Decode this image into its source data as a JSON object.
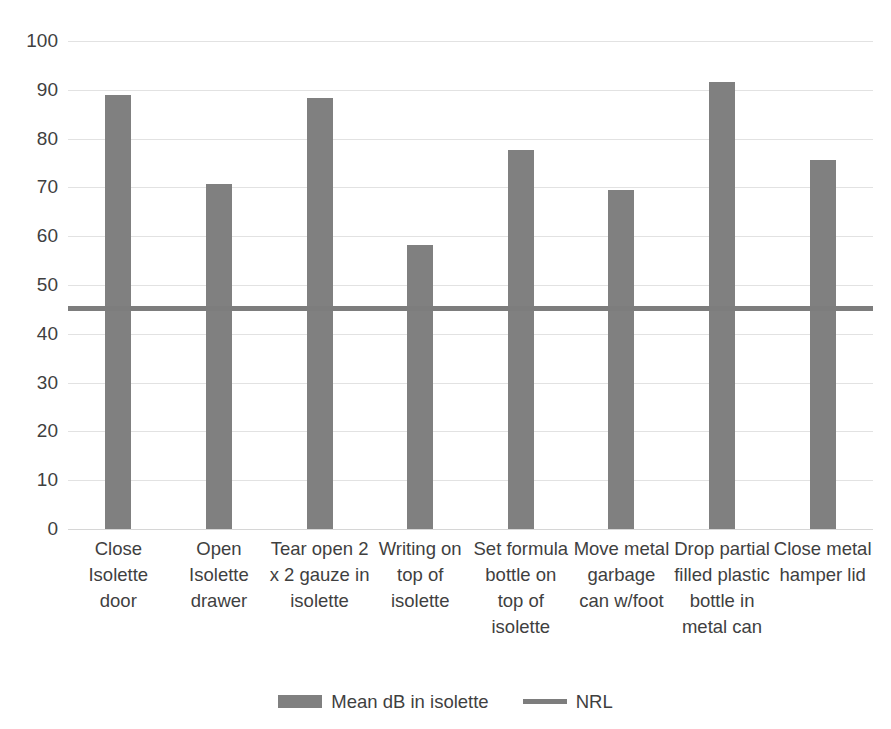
{
  "chart_data": {
    "type": "bar",
    "title": "",
    "subtitle": "",
    "xlabel": "",
    "ylabel": "",
    "ylim": [
      0,
      100
    ],
    "ytick_step": 10,
    "yticks": [
      100,
      90,
      80,
      70,
      60,
      50,
      40,
      30,
      20,
      10,
      0
    ],
    "grid": true,
    "legend_position": "bottom",
    "categories": [
      "Close Isolette door",
      "Open Isolette drawer",
      "Tear open 2 x 2 gauze in isolette",
      "Writing on top of isolette",
      "Set formula bottle on top of isolette",
      "Move metal garbage can w/foot",
      "Drop partial filled plastic bottle in metal can",
      "Close metal hamper lid"
    ],
    "series": [
      {
        "name": "Mean dB in isolette",
        "type": "bar",
        "color": "#808080",
        "values": [
          89.0,
          70.7,
          88.4,
          58.2,
          77.6,
          69.5,
          91.7,
          75.6
        ]
      },
      {
        "name": "NRL",
        "type": "line",
        "color": "#7d7d7d",
        "constant_value": 45,
        "values": [
          45,
          45,
          45,
          45,
          45,
          45,
          45,
          45
        ]
      }
    ]
  },
  "legend": {
    "entries": [
      {
        "label": "Mean dB in isolette",
        "swatch": "bar-swatch"
      },
      {
        "label": "NRL",
        "swatch": "line-swatch"
      }
    ]
  },
  "colors": {
    "bar": "#808080",
    "line": "#7d7d7d",
    "gridline": "#e2e2e2",
    "text": "#3f3f3f",
    "background": "#ffffff"
  }
}
